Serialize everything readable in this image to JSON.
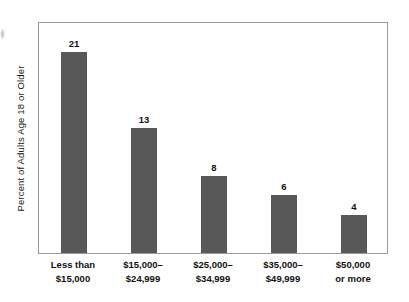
{
  "chart_data": {
    "type": "bar",
    "title": "",
    "subtitle": "",
    "xlabel": "",
    "ylabel": "Percent of Adults Age 18 or Older",
    "ylim": [
      0,
      24
    ],
    "grid": false,
    "legend": false,
    "orientation": "vertical",
    "bar_color": "#585858",
    "frame_color": "#9a9a9a",
    "background_color": "#ffffff",
    "value_label_position": "above-bar",
    "categories": [
      "Less than $15,000",
      "$15,000–$24,999",
      "$25,000–$34,999",
      "$35,000–$49,999",
      "$50,000 or more"
    ],
    "category_lines": [
      [
        "Less than",
        "$15,000"
      ],
      [
        "$15,000–",
        "$24,999"
      ],
      [
        "$25,000–",
        "$34,999"
      ],
      [
        "$35,000–",
        "$49,999"
      ],
      [
        "$50,000",
        "or more"
      ]
    ],
    "values": [
      21,
      13,
      8,
      6,
      4
    ],
    "value_labels": [
      "21",
      "13",
      "8",
      "6",
      "4"
    ]
  },
  "axes": {
    "y_title": "Percent of Adults Age 18 or Older"
  },
  "bars": [
    {
      "label": "Less than $15,000",
      "line1": "Less than",
      "line2": "$15,000",
      "value": 21,
      "value_text": "21"
    },
    {
      "label": "$15,000–$24,999",
      "line1": "$15,000–",
      "line2": "$24,999",
      "value": 13,
      "value_text": "13"
    },
    {
      "label": "$25,000–$34,999",
      "line1": "$25,000–",
      "line2": "$34,999",
      "value": 8,
      "value_text": "8"
    },
    {
      "label": "$35,000–$49,999",
      "line1": "$35,000–",
      "line2": "$49,999",
      "value": 6,
      "value_text": "6"
    },
    {
      "label": "$50,000 or more",
      "line1": "$50,000",
      "line2": "or more",
      "value": 4,
      "value_text": "4"
    }
  ]
}
